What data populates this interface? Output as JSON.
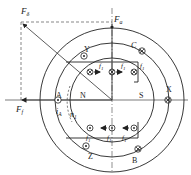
{
  "diagram": {
    "type": "electric-machine-cross-section",
    "vectors": {
      "F_delta": {
        "label": "F",
        "sub": "δ"
      },
      "F_a": {
        "label": "F",
        "sub": "a"
      },
      "F_f": {
        "label": "F",
        "sub": "f"
      }
    },
    "stator_coils": [
      {
        "label": "A",
        "symbol": "dot"
      },
      {
        "label": "Y",
        "symbol": "dot"
      },
      {
        "label": "C",
        "symbol": "cross"
      },
      {
        "label": "X",
        "symbol": "cross"
      },
      {
        "label": "B",
        "symbol": "cross"
      },
      {
        "label": "Z",
        "symbol": "dot"
      }
    ],
    "rotor_poles": {
      "north": "N",
      "south": "S"
    },
    "force_label": "f",
    "force_sub": "1",
    "current_label": "i",
    "current_sub": "A",
    "speed_label": "n",
    "speed_sub": "1"
  }
}
